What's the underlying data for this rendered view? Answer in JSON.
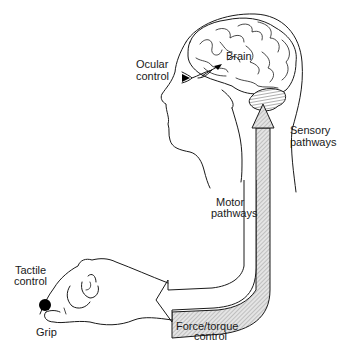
{
  "diagram": {
    "type": "human sensorimotor control loop illustration",
    "labels": {
      "ocular_line1": "Ocular",
      "ocular_line2": "control",
      "brain": "Brain",
      "sensory_line1": "Sensory",
      "sensory_line2": "pathways",
      "motor_line1": "Motor",
      "motor_line2": "pathways",
      "tactile_line1": "Tactile",
      "tactile_line2": "control",
      "grip": "Grip",
      "force_line1": "Force/torque",
      "force_line2": "control"
    },
    "elements": [
      {
        "name": "head",
        "kind": "line-drawing"
      },
      {
        "name": "brain",
        "kind": "line-drawing"
      },
      {
        "name": "cerebellum",
        "kind": "hatched-shape"
      },
      {
        "name": "eye",
        "kind": "icon"
      },
      {
        "name": "hand",
        "kind": "line-drawing"
      },
      {
        "name": "gripped-object",
        "kind": "black-circle"
      },
      {
        "name": "sensory-pathway-arrow",
        "direction": "hand-to-brain",
        "fill": "hatched"
      },
      {
        "name": "motor-pathway-arrow",
        "direction": "brain-to-hand",
        "fill": "white"
      }
    ],
    "colors": {
      "line": "#1a1a1a",
      "background": "#ffffff",
      "hatch": "#c8c8c8",
      "object": "#000000"
    }
  }
}
